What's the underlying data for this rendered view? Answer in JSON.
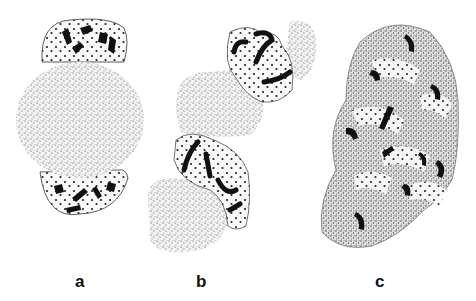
{
  "figure": {
    "panels": [
      {
        "label": "a",
        "description": "stippled rounded cell with dark chromosome fragments at top and bottom poles"
      },
      {
        "label": "b",
        "description": "elongated stippled cell cluster with curved dark chromosome segments"
      },
      {
        "label": "c",
        "description": "large irregular stippled cell with scattered dark chromosome fragments"
      }
    ],
    "colors": {
      "stipple": "#5a5a5a",
      "chromosome": "#111111",
      "background": "#ffffff"
    }
  }
}
